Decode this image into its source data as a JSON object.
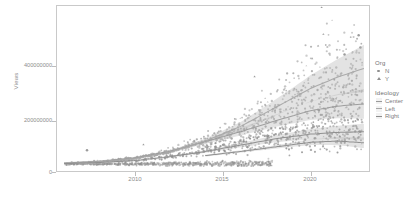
{
  "chart_data": {
    "type": "scatter",
    "title": "",
    "xlabel": "",
    "ylabel": "Views",
    "xlim": [
      2005.6,
      2023.4
    ],
    "ylim": [
      -30000000,
      545000000
    ],
    "xticks": [
      2010,
      2015,
      2020
    ],
    "xticklabels": [
      "2010",
      "2015",
      "2020"
    ],
    "yticks": [
      0,
      200000000,
      400000000
    ],
    "yticklabels": [
      "0",
      "200000000",
      "400000000"
    ],
    "grid": false,
    "legend_position": "right",
    "shape_legend": {
      "title": "Org",
      "entries": [
        {
          "label": "N",
          "marker": "circle"
        },
        {
          "label": "Y",
          "marker": "triangle"
        }
      ]
    },
    "color_legend": {
      "title": "Ideology",
      "entries": [
        {
          "label": "Center",
          "color": "#9a9a9a"
        },
        {
          "label": "Left",
          "color": "#a6a6a6"
        },
        {
          "label": "Right",
          "color": "#8c8c8c"
        }
      ]
    },
    "series": [
      {
        "name": "Center",
        "color": "#9a9a9a",
        "trend": {
          "x": [
            2006.0,
            2008.0,
            2010.0,
            2012.0,
            2014.0,
            2016.0,
            2018.0,
            2020.0,
            2021.5,
            2023.0
          ],
          "y": [
            4000000,
            10000000,
            22000000,
            45000000,
            78000000,
            112000000,
            150000000,
            185000000,
            200000000,
            208000000
          ]
        }
      },
      {
        "name": "Left",
        "color": "#a6a6a6",
        "trend": {
          "x": [
            2006.0,
            2008.0,
            2010.0,
            2012.0,
            2014.0,
            2016.0,
            2018.0,
            2020.0,
            2021.5,
            2023.0
          ],
          "y": [
            3000000,
            9000000,
            20000000,
            42000000,
            80000000,
            130000000,
            196000000,
            262000000,
            300000000,
            330000000
          ]
        }
      },
      {
        "name": "Right",
        "color": "#8c8c8c",
        "trend": {
          "x": [
            2006.0,
            2008.0,
            2010.0,
            2012.0,
            2014.0,
            2016.0,
            2018.0,
            2020.0,
            2021.5,
            2023.0
          ],
          "y": [
            2500000,
            6000000,
            13000000,
            26000000,
            44000000,
            66000000,
            88000000,
            104000000,
            110000000,
            112000000
          ]
        }
      },
      {
        "name": "Right-lower",
        "color": "#8c8c8c",
        "trend": {
          "x": [
            2014.0,
            2016.0,
            2018.0,
            2020.0,
            2021.5,
            2023.0
          ],
          "y": [
            30000000,
            44000000,
            60000000,
            76000000,
            80000000,
            74000000
          ]
        }
      }
    ],
    "notable_points": [
      {
        "x": 2020.6,
        "y": 540000000,
        "marker": "triangle"
      },
      {
        "x": 2020.7,
        "y": 448000000,
        "marker": "triangle"
      },
      {
        "x": 2022.7,
        "y": 444000000,
        "marker": "circle"
      },
      {
        "x": 2020.4,
        "y": 408000000,
        "marker": "triangle"
      },
      {
        "x": 2022.8,
        "y": 402000000,
        "marker": "circle"
      },
      {
        "x": 2021.9,
        "y": 378000000,
        "marker": "circle"
      },
      {
        "x": 2007.3,
        "y": 48000000,
        "marker": "circle"
      },
      {
        "x": 2010.5,
        "y": 68000000,
        "marker": "triangle"
      },
      {
        "x": 2016.8,
        "y": 302000000,
        "marker": "triangle"
      }
    ]
  }
}
